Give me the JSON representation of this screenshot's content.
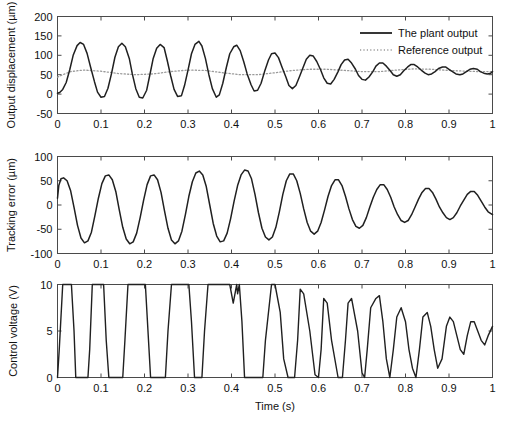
{
  "figure": {
    "title": "",
    "xlabel": "Time (s)"
  },
  "legend": {
    "position": "top-right-panel1",
    "entries": [
      {
        "label": "The plant output",
        "style": "solid",
        "color": "#202020"
      },
      {
        "label": "Reference output",
        "style": "dotted",
        "color": "#9a9a9a"
      }
    ]
  },
  "chart_data": [
    {
      "type": "line",
      "panel": 1,
      "title": "",
      "xlabel": "",
      "ylabel": "Output displacement (µm)",
      "xlim": [
        0,
        1
      ],
      "ylim": [
        -50,
        200
      ],
      "xticks": [
        0,
        0.1,
        0.2,
        0.3,
        0.4,
        0.5,
        0.6,
        0.7,
        0.8,
        0.9,
        1
      ],
      "xticklabels": [
        "0",
        "0.1",
        "0.2",
        "0.3",
        "0.4",
        "0.5",
        "0.6",
        "0.7",
        "0.8",
        "0.9",
        "1"
      ],
      "yticks": [
        -50,
        0,
        50,
        100,
        150,
        200
      ],
      "yticklabels": [
        "-50",
        "0",
        "50",
        "100",
        "150",
        "200"
      ],
      "grid": false,
      "series": [
        {
          "name": "The plant output",
          "style": "solid",
          "color": "#202020",
          "x": [
            0,
            0.005,
            0.012,
            0.02,
            0.028,
            0.036,
            0.045,
            0.052,
            0.06,
            0.068,
            0.076,
            0.085,
            0.092,
            0.1,
            0.108,
            0.116,
            0.124,
            0.132,
            0.14,
            0.148,
            0.156,
            0.165,
            0.172,
            0.18,
            0.188,
            0.196,
            0.205,
            0.212,
            0.22,
            0.228,
            0.236,
            0.245,
            0.252,
            0.26,
            0.268,
            0.276,
            0.285,
            0.292,
            0.3,
            0.308,
            0.316,
            0.325,
            0.332,
            0.34,
            0.348,
            0.356,
            0.365,
            0.372,
            0.38,
            0.388,
            0.396,
            0.405,
            0.412,
            0.42,
            0.428,
            0.436,
            0.445,
            0.452,
            0.46,
            0.468,
            0.476,
            0.485,
            0.492,
            0.5,
            0.508,
            0.516,
            0.525,
            0.532,
            0.54,
            0.548,
            0.556,
            0.565,
            0.572,
            0.58,
            0.588,
            0.596,
            0.605,
            0.612,
            0.62,
            0.628,
            0.636,
            0.645,
            0.652,
            0.66,
            0.668,
            0.676,
            0.685,
            0.692,
            0.7,
            0.708,
            0.716,
            0.725,
            0.732,
            0.74,
            0.748,
            0.756,
            0.765,
            0.772,
            0.78,
            0.788,
            0.796,
            0.805,
            0.812,
            0.82,
            0.828,
            0.836,
            0.845,
            0.852,
            0.86,
            0.868,
            0.876,
            0.885,
            0.892,
            0.9,
            0.908,
            0.916,
            0.925,
            0.932,
            0.94,
            0.948,
            0.956,
            0.965,
            0.972,
            0.98,
            0.988,
            0.996,
            1
          ],
          "y": [
            2,
            4,
            12,
            30,
            62,
            100,
            125,
            133,
            128,
            105,
            70,
            32,
            5,
            -8,
            -6,
            15,
            52,
            95,
            122,
            131,
            122,
            92,
            52,
            14,
            -8,
            -10,
            10,
            48,
            92,
            118,
            128,
            120,
            88,
            48,
            12,
            -6,
            -4,
            22,
            62,
            104,
            128,
            136,
            124,
            92,
            50,
            14,
            -8,
            -2,
            28,
            68,
            104,
            122,
            126,
            112,
            84,
            52,
            24,
            8,
            10,
            28,
            58,
            88,
            104,
            106,
            94,
            70,
            44,
            22,
            14,
            22,
            44,
            70,
            90,
            100,
            98,
            84,
            62,
            42,
            28,
            26,
            38,
            58,
            76,
            88,
            90,
            80,
            64,
            48,
            38,
            36,
            44,
            58,
            72,
            80,
            80,
            72,
            60,
            50,
            46,
            50,
            60,
            70,
            76,
            76,
            70,
            62,
            54,
            50,
            52,
            58,
            66,
            70,
            70,
            64,
            58,
            52,
            50,
            52,
            58,
            64,
            66,
            64,
            58,
            54,
            52,
            54,
            58,
            62,
            62
          ]
        },
        {
          "name": "Reference output",
          "style": "dotted",
          "color": "#9a9a9a",
          "x": [
            0,
            0.03,
            0.06,
            0.1,
            0.14,
            0.18,
            0.22,
            0.26,
            0.3,
            0.34,
            0.38,
            0.42,
            0.46,
            0.5,
            0.54,
            0.58,
            0.62,
            0.66,
            0.7,
            0.74,
            0.78,
            0.82,
            0.86,
            0.9,
            0.94,
            0.97,
            1
          ],
          "y": [
            44,
            58,
            62,
            59,
            53,
            50,
            52,
            58,
            62,
            61,
            55,
            50,
            50,
            55,
            61,
            64,
            64,
            61,
            58,
            58,
            62,
            65,
            64,
            61,
            59,
            58,
            58
          ]
        }
      ]
    },
    {
      "type": "line",
      "panel": 2,
      "title": "",
      "xlabel": "",
      "ylabel": "Tracking error (µm)",
      "xlim": [
        0,
        1
      ],
      "ylim": [
        -100,
        100
      ],
      "xticks": [
        0,
        0.1,
        0.2,
        0.3,
        0.4,
        0.5,
        0.6,
        0.7,
        0.8,
        0.9,
        1
      ],
      "xticklabels": [
        "0",
        "0.1",
        "0.2",
        "0.3",
        "0.4",
        "0.5",
        "0.6",
        "0.7",
        "0.8",
        "0.9",
        "1"
      ],
      "yticks": [
        -100,
        -50,
        0,
        50,
        100
      ],
      "yticklabels": [
        "-100",
        "-50",
        "0",
        "50",
        "100"
      ],
      "grid": false,
      "series": [
        {
          "name": "Tracking error",
          "style": "solid",
          "color": "#202020",
          "x": [
            0,
            0.003,
            0.008,
            0.014,
            0.022,
            0.03,
            0.038,
            0.046,
            0.054,
            0.062,
            0.07,
            0.078,
            0.086,
            0.094,
            0.102,
            0.11,
            0.118,
            0.126,
            0.134,
            0.142,
            0.15,
            0.158,
            0.166,
            0.174,
            0.182,
            0.19,
            0.198,
            0.206,
            0.214,
            0.222,
            0.23,
            0.238,
            0.246,
            0.254,
            0.262,
            0.27,
            0.278,
            0.286,
            0.294,
            0.302,
            0.31,
            0.318,
            0.326,
            0.334,
            0.342,
            0.35,
            0.358,
            0.366,
            0.374,
            0.382,
            0.39,
            0.398,
            0.406,
            0.414,
            0.422,
            0.43,
            0.438,
            0.446,
            0.454,
            0.462,
            0.47,
            0.478,
            0.486,
            0.494,
            0.502,
            0.51,
            0.518,
            0.526,
            0.534,
            0.542,
            0.55,
            0.558,
            0.566,
            0.574,
            0.582,
            0.59,
            0.598,
            0.606,
            0.614,
            0.622,
            0.63,
            0.638,
            0.646,
            0.654,
            0.662,
            0.67,
            0.678,
            0.686,
            0.694,
            0.702,
            0.71,
            0.718,
            0.726,
            0.734,
            0.742,
            0.75,
            0.758,
            0.766,
            0.774,
            0.782,
            0.79,
            0.798,
            0.806,
            0.814,
            0.822,
            0.83,
            0.838,
            0.846,
            0.854,
            0.862,
            0.87,
            0.878,
            0.886,
            0.894,
            0.902,
            0.91,
            0.918,
            0.926,
            0.934,
            0.942,
            0.95,
            0.958,
            0.966,
            0.974,
            0.982,
            0.99,
            1
          ],
          "y": [
            14,
            40,
            54,
            56,
            50,
            30,
            -5,
            -42,
            -68,
            -78,
            -74,
            -56,
            -22,
            14,
            44,
            60,
            62,
            52,
            28,
            -10,
            -46,
            -70,
            -80,
            -76,
            -58,
            -26,
            10,
            42,
            60,
            62,
            52,
            26,
            -12,
            -48,
            -72,
            -80,
            -74,
            -54,
            -20,
            18,
            48,
            66,
            70,
            62,
            38,
            0,
            -38,
            -64,
            -76,
            -74,
            -58,
            -28,
            8,
            40,
            62,
            72,
            70,
            54,
            22,
            -16,
            -48,
            -66,
            -72,
            -66,
            -46,
            -14,
            22,
            50,
            64,
            64,
            50,
            24,
            -8,
            -36,
            -54,
            -60,
            -54,
            -36,
            -10,
            18,
            40,
            52,
            52,
            40,
            18,
            -8,
            -30,
            -44,
            -48,
            -42,
            -26,
            -4,
            16,
            32,
            42,
            42,
            32,
            16,
            -4,
            -20,
            -32,
            -36,
            -32,
            -20,
            -4,
            12,
            26,
            34,
            34,
            26,
            12,
            -4,
            -16,
            -26,
            -30,
            -26,
            -16,
            -2,
            10,
            22,
            28,
            28,
            20,
            8,
            -4,
            -14,
            -20,
            -18
          ]
        }
      ]
    },
    {
      "type": "line",
      "panel": 3,
      "title": "",
      "xlabel": "Time (s)",
      "ylabel": "Control voltage (V)",
      "xlim": [
        0,
        1
      ],
      "ylim": [
        0,
        10
      ],
      "xticks": [
        0,
        0.1,
        0.2,
        0.3,
        0.4,
        0.5,
        0.6,
        0.7,
        0.8,
        0.9,
        1
      ],
      "xticklabels": [
        "0",
        "0.1",
        "0.2",
        "0.3",
        "0.4",
        "0.5",
        "0.6",
        "0.7",
        "0.8",
        "0.9",
        "1"
      ],
      "yticks": [
        0,
        5,
        10
      ],
      "yticklabels": [
        "0",
        "5",
        "10"
      ],
      "grid": false,
      "series": [
        {
          "name": "Control voltage",
          "style": "solid",
          "color": "#202020",
          "x": [
            0,
            0.004,
            0.012,
            0.026,
            0.032,
            0.038,
            0.042,
            0.07,
            0.074,
            0.08,
            0.088,
            0.1,
            0.106,
            0.112,
            0.118,
            0.15,
            0.155,
            0.162,
            0.17,
            0.196,
            0.202,
            0.208,
            0.214,
            0.248,
            0.254,
            0.262,
            0.27,
            0.296,
            0.302,
            0.308,
            0.315,
            0.332,
            0.338,
            0.346,
            0.356,
            0.39,
            0.396,
            0.404,
            0.412,
            0.414,
            0.418,
            0.424,
            0.43,
            0.472,
            0.478,
            0.492,
            0.5,
            0.512,
            0.52,
            0.53,
            0.545,
            0.552,
            0.558,
            0.566,
            0.58,
            0.592,
            0.6,
            0.606,
            0.612,
            0.62,
            0.63,
            0.645,
            0.655,
            0.662,
            0.668,
            0.676,
            0.69,
            0.7,
            0.706,
            0.712,
            0.72,
            0.732,
            0.74,
            0.748,
            0.756,
            0.764,
            0.772,
            0.78,
            0.79,
            0.8,
            0.808,
            0.816,
            0.824,
            0.832,
            0.84,
            0.85,
            0.858,
            0.866,
            0.874,
            0.884,
            0.894,
            0.902,
            0.91,
            0.918,
            0.926,
            0.934,
            0.942,
            0.95,
            0.958,
            0.966,
            0.974,
            0.982,
            0.99,
            1
          ],
          "y": [
            0,
            3,
            10,
            10,
            10,
            5,
            0,
            0,
            3,
            10,
            10,
            10,
            10,
            4,
            0,
            0,
            4,
            10,
            10,
            10,
            10,
            5,
            0,
            0,
            5,
            10,
            10,
            10,
            10,
            6,
            0,
            0,
            5,
            10,
            10,
            10,
            10,
            8,
            10,
            9,
            10,
            6,
            0,
            0,
            4,
            10,
            10,
            7,
            2,
            0,
            0,
            4,
            9.5,
            9,
            5,
            0.3,
            0,
            3,
            8.5,
            8,
            4,
            0,
            0,
            4,
            8,
            8.5,
            5,
            0.5,
            0,
            3,
            7.5,
            8.5,
            8.8,
            6,
            2,
            0,
            3,
            6.5,
            7.5,
            6,
            3,
            1,
            0,
            3,
            6.5,
            7,
            5.5,
            3,
            1,
            2,
            5.5,
            6.5,
            6,
            4.5,
            3,
            2.5,
            4.5,
            6,
            6,
            5,
            4,
            3.5,
            4.5,
            5.5,
            5,
            3
          ]
        }
      ]
    }
  ]
}
